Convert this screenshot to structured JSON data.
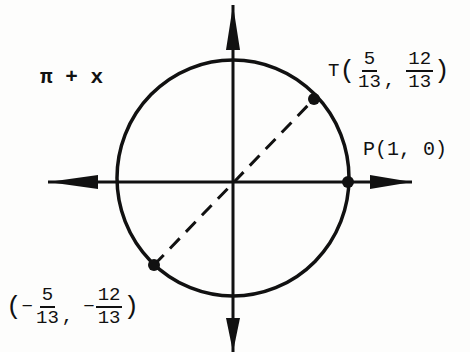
{
  "diagram": {
    "type": "unit-circle",
    "colors": {
      "ink": "#111111",
      "background": "#fdfdfc"
    },
    "angle_label": "π + x",
    "points": {
      "T": {
        "name": "T",
        "x_num": "5",
        "x_den": "13",
        "y_num": "12",
        "y_den": "13",
        "comma": ","
      },
      "P": {
        "label": "P(1, 0)"
      },
      "reflected": {
        "x_sign": "−",
        "x_num": "5",
        "x_den": "13",
        "y_sign": "−",
        "y_num": "12",
        "y_den": "13",
        "comma": ","
      }
    },
    "paren_open": "(",
    "paren_close": ")"
  }
}
